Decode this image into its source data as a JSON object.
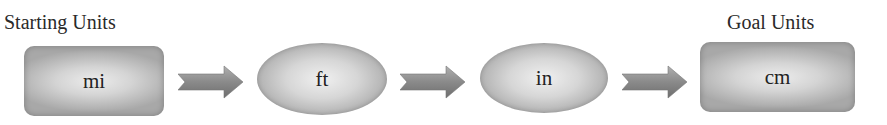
{
  "diagram": {
    "start_label": "Starting Units",
    "goal_label": "Goal Units",
    "nodes": [
      {
        "unit": "mi",
        "shape": "rounded-rectangle"
      },
      {
        "unit": "ft",
        "shape": "ellipse"
      },
      {
        "unit": "in",
        "shape": "ellipse"
      },
      {
        "unit": "cm",
        "shape": "rounded-rectangle"
      }
    ],
    "arrows": [
      {
        "from": "mi",
        "to": "ft",
        "icon": "right-arrow-icon"
      },
      {
        "from": "ft",
        "to": "in",
        "icon": "right-arrow-icon"
      },
      {
        "from": "in",
        "to": "cm",
        "icon": "right-arrow-icon"
      }
    ],
    "colors": {
      "node_fill_light": "#ececec",
      "node_fill_dark": "#a8a8a8",
      "arrow_fill": "#8c8c8c",
      "text": "#222222"
    }
  }
}
